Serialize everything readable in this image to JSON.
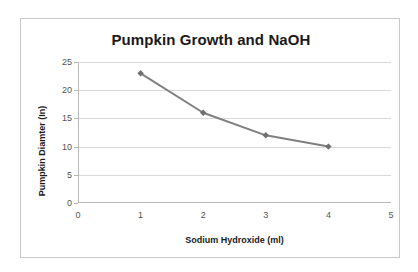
{
  "chart_data": {
    "type": "line",
    "title": "Pumpkin Growth and NaOH",
    "xlabel": "Sodium Hydroxide (ml)",
    "ylabel": "Pumpkin Diamter (In)",
    "x": [
      1,
      2,
      3,
      4
    ],
    "values": [
      23,
      16,
      12,
      10
    ],
    "series": [
      {
        "name": "Pumpkin Diamter (In)",
        "x": [
          1,
          2,
          3,
          4
        ],
        "values": [
          23,
          16,
          12,
          10
        ]
      }
    ],
    "xlim": [
      0,
      5
    ],
    "ylim": [
      0,
      25
    ],
    "x_ticks": [
      "0",
      "1",
      "2",
      "3",
      "4",
      "5"
    ],
    "y_ticks": [
      "0",
      "5",
      "10",
      "15",
      "20",
      "25"
    ],
    "grid": "horizontal",
    "legend": "none",
    "line_color": "#808080",
    "marker": "diamond",
    "marker_color": "#707070",
    "gridline_color": "#d9d9d9",
    "axis_color": "#b8b8b8",
    "background_color": "#ffffff",
    "border_color": "#c9c9c9",
    "title_color": "#1a1a1a"
  }
}
